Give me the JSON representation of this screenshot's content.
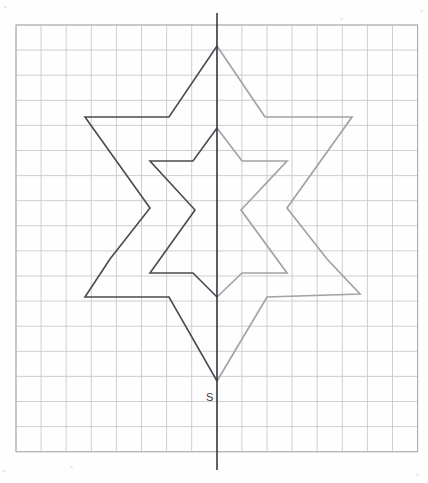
{
  "page": {
    "background_color": "#fefefe"
  },
  "grid": {
    "origin_x": 16,
    "origin_y": 25,
    "cell_size": 25.1,
    "columns": 16,
    "rows": 17,
    "line_color": "#c9c9cc",
    "border_color": "#b0b0b4",
    "visible": true
  },
  "axis": {
    "name": "axis-of-symmetry",
    "orientation": "vertical",
    "x": 217,
    "y_top": 13,
    "y_bottom": 470,
    "color": "#2e2e34"
  },
  "labels": [
    {
      "text": "S",
      "x": 206,
      "y": 401,
      "color": "#3a3a40"
    }
  ],
  "chart_data": {
    "type": "line",
    "xlabel": "",
    "ylabel": "",
    "grid": true,
    "legend": "none",
    "xlim": [
      16,
      411
    ],
    "ylim": [
      25,
      457
    ],
    "annotations": [
      {
        "label": "S",
        "x": 217,
        "y": 381,
        "note": "bottom apex vertex of the star, labelled S"
      }
    ],
    "series": [
      {
        "name": "outer-star-left-half-original",
        "color": "#4a4a52",
        "style": "solid",
        "points": [
          [
            217,
            46
          ],
          [
            169,
            117
          ],
          [
            85,
            117
          ],
          [
            150,
            208
          ],
          [
            110,
            259
          ],
          [
            85,
            297
          ],
          [
            169,
            297
          ],
          [
            217,
            381
          ]
        ]
      },
      {
        "name": "outer-star-right-half-reflection",
        "color": "#a2a2a8",
        "style": "solid",
        "points": [
          [
            217,
            46
          ],
          [
            265,
            117
          ],
          [
            352,
            117
          ],
          [
            287,
            208
          ],
          [
            327,
            259
          ],
          [
            360,
            294
          ],
          [
            267,
            297
          ],
          [
            217,
            381
          ]
        ]
      },
      {
        "name": "inner-star-left-half-original",
        "color": "#4a4a52",
        "style": "solid",
        "points": [
          [
            217,
            128
          ],
          [
            193,
            161
          ],
          [
            150,
            161
          ],
          [
            195,
            210
          ],
          [
            150,
            273
          ],
          [
            193,
            273
          ],
          [
            217,
            297
          ]
        ]
      },
      {
        "name": "inner-star-right-half-reflection",
        "color": "#a2a2a8",
        "style": "solid",
        "points": [
          [
            217,
            128
          ],
          [
            242,
            161
          ],
          [
            287,
            161
          ],
          [
            241,
            210
          ],
          [
            287,
            273
          ],
          [
            242,
            273
          ],
          [
            217,
            297
          ]
        ]
      }
    ]
  }
}
